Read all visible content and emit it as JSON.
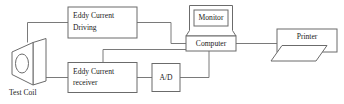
{
  "diagram": {
    "background_color": "#ffffff",
    "line_color": "#7a7a7a",
    "box_stroke_color": "#6b6b6b",
    "text_color": "#1a1a1a",
    "nodes": {
      "test_coil": {
        "caption": "Test Coil",
        "shape": "coil-prism"
      },
      "eddy_current_driving": {
        "line1": "Eddy Current",
        "line2": "Driving",
        "shape": "rectangle"
      },
      "eddy_current_receiver": {
        "line1": "Eddy Current",
        "line2": "receiver",
        "shape": "rectangle"
      },
      "ad_converter": {
        "label": "A/D",
        "shape": "rectangle"
      },
      "computer": {
        "label": "Computer",
        "shape": "rectangle"
      },
      "monitor": {
        "label": "Monitor",
        "shape": "monitor-case"
      },
      "printer": {
        "label": "Printer",
        "shape": "printer-with-paper"
      }
    },
    "connections": [
      "test-coil-to-eddy-current-driving",
      "eddy-current-driving-to-computer",
      "test-coil-to-eddy-current-receiver",
      "eddy-current-receiver-to-ad-converter",
      "eddy-current-receiver-to-computer",
      "ad-converter-to-computer",
      "computer-to-printer",
      "monitor-to-computer"
    ]
  }
}
